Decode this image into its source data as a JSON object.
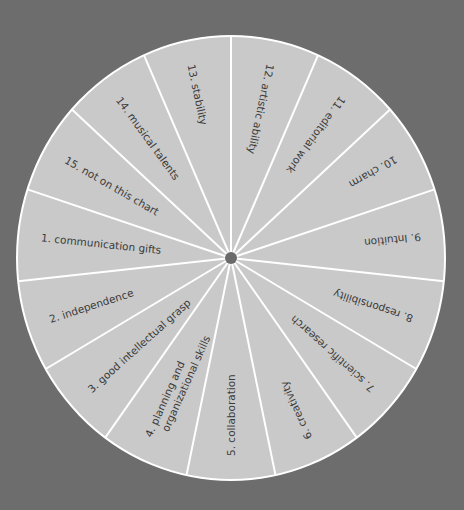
{
  "colors": {
    "background": "#6d6d6d",
    "wheel_fill": "#c9c9c9",
    "divider": "#ffffff",
    "hub": "#6a6a6a",
    "text": "#3a3a3a"
  },
  "wheel": {
    "center_x": 231,
    "center_y": 258,
    "radius_x": 214,
    "radius_y": 222,
    "slice_count": 15,
    "label_start_radius": 198,
    "slices": [
      {
        "number": "1.",
        "label": "communication gifts",
        "angle": 186
      },
      {
        "number": "2.",
        "label": "independence",
        "angle": 162
      },
      {
        "number": "3.",
        "label": "good intellectual grasp",
        "angle": 138
      },
      {
        "number": "4.",
        "label": "planning and",
        "label2": "organizational skills",
        "angle": 114
      },
      {
        "number": "5.",
        "label": "collaboration",
        "angle": 90
      },
      {
        "number": "6.",
        "label": "creativity",
        "angle": 66
      },
      {
        "number": "7.",
        "label": "scientific research",
        "angle": 42
      },
      {
        "number": "8.",
        "label": "responsibility",
        "angle": 18
      },
      {
        "number": "9.",
        "label": "Intuition",
        "angle": -6
      },
      {
        "number": "10.",
        "label": "charm",
        "angle": -30
      },
      {
        "number": "11.",
        "label": "editorial work",
        "angle": -54
      },
      {
        "number": "12.",
        "label": "artistic ability",
        "angle": -78
      },
      {
        "number": "13.",
        "label": "stability",
        "angle": -102
      },
      {
        "number": "14.",
        "label": "musical talents",
        "angle": -126
      },
      {
        "number": "15.",
        "label": "not on this chart",
        "angle": -150
      }
    ]
  }
}
